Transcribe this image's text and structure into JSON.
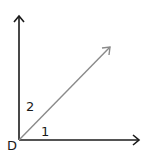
{
  "diagram": {
    "type": "angle-diagram",
    "vertex": {
      "label": "D"
    },
    "rays": [
      {
        "name": "vertical-ray",
        "direction": "up",
        "color": "#1a1a1a"
      },
      {
        "name": "horizontal-ray",
        "direction": "right",
        "color": "#1a1a1a"
      },
      {
        "name": "diagonal-ray",
        "direction": "up-right",
        "color": "#8a8a8a"
      }
    ],
    "angles": [
      {
        "label": "1",
        "between": [
          "horizontal-ray",
          "diagonal-ray"
        ]
      },
      {
        "label": "2",
        "between": [
          "diagonal-ray",
          "vertical-ray"
        ]
      }
    ]
  }
}
